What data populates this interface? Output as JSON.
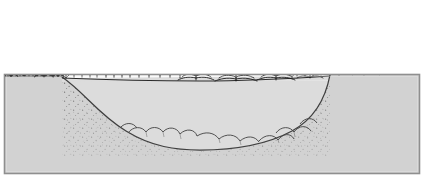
{
  "figure": {
    "title": "Cross section of a filled kettle bog basin",
    "type": "geological-cross-section",
    "caption": "",
    "width_px": 424,
    "height_px": 180
  },
  "colors": {
    "background": "#ffffff",
    "ground_fill": "#d2d2d2",
    "basin_fill": "#dcdcdc",
    "outline": "#3a3a3a",
    "border": "#8f8f8f",
    "ink": "#1a1a1a",
    "stipple": "#6b6b6b"
  },
  "frame": {
    "label": "diagram-border",
    "x": 4,
    "y": 74,
    "width": 416,
    "height": 100,
    "stroke": "#8f8f8f"
  },
  "sky": {
    "label": "sky",
    "fill": "#ffffff"
  },
  "ground": {
    "label": "ground-block",
    "surface_left_y": 76,
    "surface_right_y": 74,
    "fill": "#d2d2d2"
  },
  "basin": {
    "label": "kettle-basin-depression",
    "rim_left_x": 62,
    "rim_right_x": 330,
    "floor_y": 146,
    "max_depth_px": 70,
    "fill": "#dcdcdc",
    "sediment_label": "stippled organic sediment fill",
    "floor_label": "scalloped boulder and till floor"
  },
  "vegetation": {
    "zones": [
      {
        "id": "zone-left-conifer",
        "label": "Upland conifer forest (left rim)",
        "type": "conifer",
        "count": 4,
        "x_range": [
          8,
          52
        ]
      },
      {
        "id": "zone-left-shrub",
        "label": "Shrub thicket (left rim margin)",
        "type": "shrub",
        "count": 9,
        "x_range": [
          52,
          96
        ]
      },
      {
        "id": "zone-left-sapling",
        "label": "Deciduous saplings and bare stems",
        "type": "sapling",
        "count": 10,
        "x_range": [
          96,
          175
        ]
      },
      {
        "id": "zone-center-sedge",
        "label": "Sedge and grass tufts on bog mat",
        "type": "sedge-tuft",
        "count": 4,
        "x_range": [
          178,
          292
        ]
      },
      {
        "id": "zone-right-shrub",
        "label": "Shrub thicket (right rim margin)",
        "type": "shrub",
        "count": 11,
        "x_range": [
          300,
          360
        ]
      },
      {
        "id": "zone-right-conifer",
        "label": "Upland conifer forest (right rim)",
        "type": "conifer",
        "count": 5,
        "x_range": [
          352,
          412
        ]
      }
    ],
    "conifers_left": [
      {
        "x": 24,
        "base_y": 76,
        "height": 56,
        "width": 26
      },
      {
        "x": 44,
        "base_y": 76,
        "height": 44,
        "width": 20
      },
      {
        "x": 11,
        "base_y": 77,
        "height": 34,
        "width": 16
      },
      {
        "x": 58,
        "base_y": 77,
        "height": 28,
        "width": 13
      }
    ],
    "conifers_right": [
      {
        "x": 391,
        "base_y": 74,
        "height": 56,
        "width": 25
      },
      {
        "x": 413,
        "base_y": 74,
        "height": 48,
        "width": 21
      },
      {
        "x": 372,
        "base_y": 75,
        "height": 38,
        "width": 18
      },
      {
        "x": 357,
        "base_y": 76,
        "height": 26,
        "width": 13
      },
      {
        "x": 404,
        "base_y": 75,
        "height": 22,
        "width": 11
      }
    ],
    "saplings": [
      {
        "x": 100,
        "base_y": 77,
        "height": 20
      },
      {
        "x": 109,
        "base_y": 77,
        "height": 24
      },
      {
        "x": 117,
        "base_y": 77,
        "height": 22
      },
      {
        "x": 125,
        "base_y": 77,
        "height": 25
      },
      {
        "x": 133,
        "base_y": 77,
        "height": 21
      },
      {
        "x": 142,
        "base_y": 77,
        "height": 24
      },
      {
        "x": 152,
        "base_y": 77,
        "height": 19
      },
      {
        "x": 161,
        "base_y": 77,
        "height": 22
      },
      {
        "x": 170,
        "base_y": 77,
        "height": 16
      },
      {
        "x": 178,
        "base_y": 77,
        "height": 13
      }
    ],
    "sedge_tufts": [
      {
        "x": 196,
        "base_y": 81,
        "spread": 22
      },
      {
        "x": 236,
        "base_y": 82,
        "spread": 24
      },
      {
        "x": 276,
        "base_y": 81,
        "spread": 22
      },
      {
        "x": 312,
        "base_y": 80,
        "spread": 16
      }
    ]
  },
  "annotations": []
}
